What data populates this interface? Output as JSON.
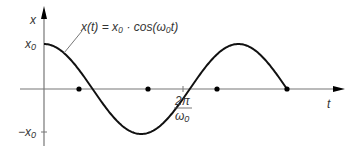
{
  "chart_data": {
    "type": "line",
    "title": "",
    "annotation": "x(t) = x₀ · cos(ω₀t)",
    "xlabel": "t",
    "ylabel": "x",
    "y_ticks": [
      "x₀",
      "−x₀"
    ],
    "x_ticks": [
      {
        "num": "2π",
        "den": "ω₀"
      }
    ],
    "series": [
      {
        "name": "x(t)",
        "function": "x0*cos(w0*t)",
        "t_range": [
          "0",
          "2.5π/ω₀"
        ]
      }
    ],
    "marked_points": [
      "π/2ω₀",
      "3π/2ω₀",
      "5π/2ω₀",
      "7π/2ω₀"
    ],
    "grid": false,
    "legend": "none"
  },
  "labels": {
    "y_axis": "x",
    "x_axis": "t",
    "y_top": "x",
    "y_top_sub": "0",
    "y_bottom": "−x",
    "y_bottom_sub": "0",
    "tick_num": "2π",
    "tick_den": "ω",
    "tick_den_sub": "0",
    "formula": "x(t) = x₀ · cos(ω₀t)"
  }
}
